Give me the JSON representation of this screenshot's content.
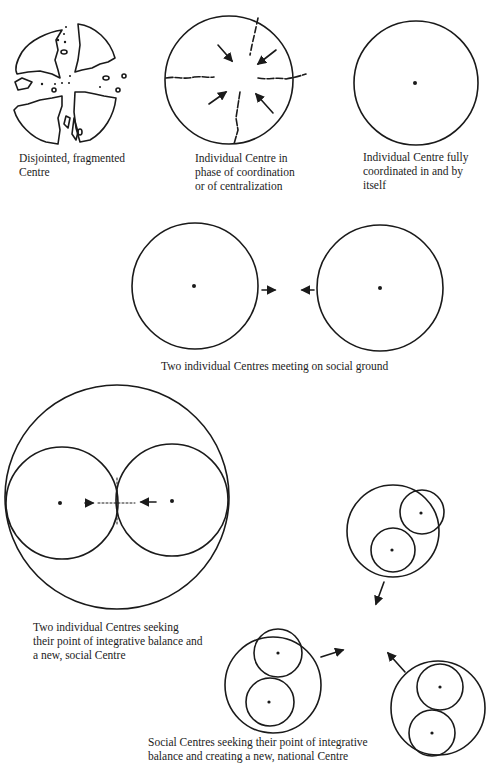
{
  "figure": {
    "panels": [
      {
        "id": "fragmented",
        "caption_lines": [
          "Disjointed, fragmented",
          "Centre"
        ]
      },
      {
        "id": "coordination",
        "caption_lines": [
          "Individual Centre in",
          "phase of coordination",
          "or of centralization"
        ]
      },
      {
        "id": "coordinated",
        "caption_lines": [
          "Individual Centre fully",
          "coordinated in and by",
          "itself"
        ]
      },
      {
        "id": "meeting",
        "caption_lines": [
          "Two individual Centres meeting on social ground"
        ]
      },
      {
        "id": "integrative",
        "caption_lines": [
          "Two individual Centres seeking",
          "their point of integrative balance and",
          "a new, social Centre"
        ]
      },
      {
        "id": "national",
        "caption_lines": [
          "Social Centres seeking their point of integrative",
          "balance and creating a new, national Centre"
        ]
      }
    ],
    "colors": {
      "ink": "#1a1a1a",
      "paper": "#ffffff"
    }
  }
}
